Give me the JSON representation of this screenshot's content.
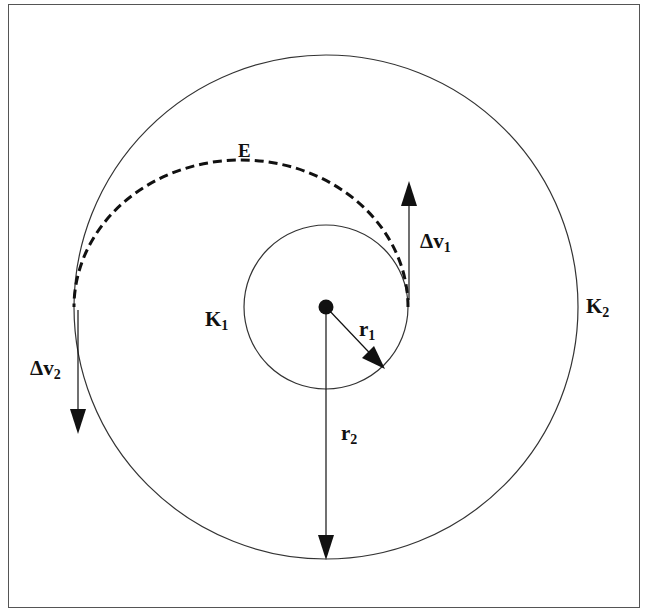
{
  "diagram": {
    "type": "hohmann-transfer-orbit",
    "colors": {
      "stroke": "#333333",
      "text": "#111111",
      "background": "#ffffff"
    },
    "labels": {
      "transfer_orbit": "E",
      "inner_orbit": "K",
      "inner_orbit_sub": "1",
      "outer_orbit": "K",
      "outer_orbit_sub": "2",
      "radius_inner": "r",
      "radius_inner_sub": "1",
      "radius_outer": "r",
      "radius_outer_sub": "2",
      "delta_v1": "Δv",
      "delta_v1_sub": "1",
      "delta_v2": "Δv",
      "delta_v2_sub": "2"
    }
  }
}
